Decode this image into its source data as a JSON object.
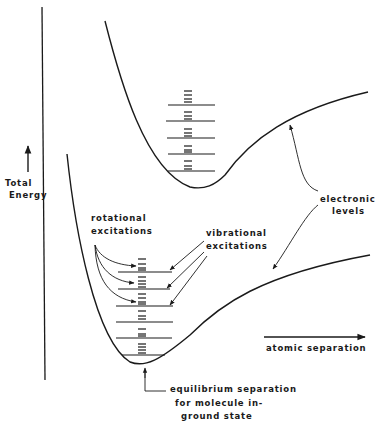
{
  "labels": {
    "y_axis": [
      "Total",
      "Energy"
    ],
    "x_axis": "atomic separation",
    "rotational": [
      "rotational",
      "excitations"
    ],
    "vibrational": [
      "vibrational",
      "excitations"
    ],
    "electronic": [
      "electronic",
      "levels"
    ],
    "equilibrium": [
      "equilibrium separation",
      "for molecule in-",
      "ground state"
    ]
  },
  "colors": {
    "ink": "#1a1a1a",
    "background": "#ffffff"
  },
  "structure": {
    "upper_state_vibrational_levels": 5,
    "ground_state_vibrational_levels": 6,
    "annotated_rotational_levels": 3,
    "annotated_vibrational_levels": 3
  }
}
